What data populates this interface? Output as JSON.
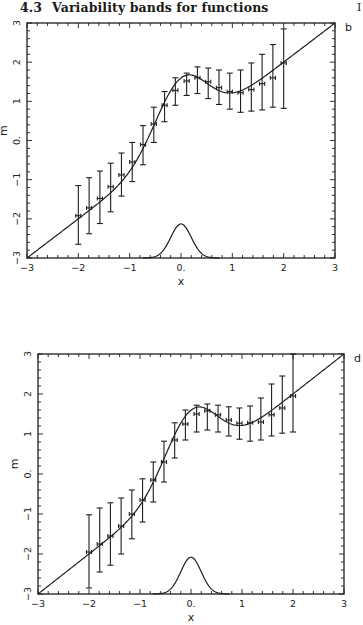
{
  "page": {
    "section_number": "4.3",
    "section_title": "Variability bands for functions",
    "clipped_margin_char": "I"
  },
  "colors": {
    "ink": "#1e1e1e",
    "background": "#ffffff"
  },
  "chart_data": [
    {
      "panel_label": "b",
      "type": "line",
      "title": "",
      "xlabel": "x",
      "ylabel": "m",
      "xlim": [
        -3,
        3
      ],
      "ylim": [
        -3,
        3
      ],
      "xticks": [
        -3,
        -2,
        -1,
        0,
        1,
        2,
        3
      ],
      "xtick_labels": [
        "-3",
        "-2",
        "-1",
        "0.",
        "1",
        "2",
        "3"
      ],
      "yticks": [
        -3,
        -2,
        -1,
        0,
        1,
        2,
        3
      ],
      "ytick_labels": [
        "-3",
        "-2",
        "-1",
        "0.",
        "1",
        "2",
        "3"
      ],
      "grid": false,
      "legend": null,
      "frame_px": {
        "left": 27,
        "top": 23,
        "right": 335,
        "bottom": 258
      },
      "curve": {
        "name": "regression function m(x)",
        "formula": "x + 4*exp(-2x^2)/sqrt(2*pi)",
        "x_range": [
          -3,
          3
        ]
      },
      "density": {
        "name": "design density (bottom bump)",
        "center": 0,
        "sigma": 0.2,
        "baseline": -3,
        "peak_height": 0.87,
        "x_range": [
          -0.75,
          0.75
        ]
      },
      "series": [
        {
          "name": "estimates with variability bands",
          "x": [
            -2.0,
            -1.79,
            -1.58,
            -1.37,
            -1.16,
            -0.95,
            -0.74,
            -0.53,
            -0.32,
            -0.11,
            0.11,
            0.32,
            0.53,
            0.74,
            0.95,
            1.16,
            1.37,
            1.58,
            1.79,
            2.0
          ],
          "y": [
            -1.92,
            -1.72,
            -1.48,
            -1.18,
            -0.88,
            -0.55,
            -0.1,
            0.42,
            0.9,
            1.28,
            1.52,
            1.6,
            1.5,
            1.35,
            1.25,
            1.22,
            1.3,
            1.45,
            1.6,
            1.98
          ],
          "lower": [
            -2.65,
            -2.38,
            -2.12,
            -1.82,
            -1.42,
            -1.05,
            -0.62,
            -0.05,
            0.48,
            0.9,
            1.15,
            1.2,
            1.07,
            0.92,
            0.8,
            0.72,
            0.75,
            0.78,
            0.85,
            0.82
          ],
          "upper": [
            -1.15,
            -0.95,
            -0.78,
            -0.58,
            -0.32,
            -0.05,
            0.38,
            0.85,
            1.25,
            1.6,
            1.72,
            1.88,
            1.85,
            1.8,
            1.72,
            1.8,
            1.98,
            2.2,
            2.45,
            2.85
          ],
          "xerr": 0.05
        }
      ]
    },
    {
      "panel_label": "d",
      "type": "line",
      "title": "",
      "xlabel": "x",
      "ylabel": "m",
      "xlim": [
        -3,
        3
      ],
      "ylim": [
        -3,
        3
      ],
      "xticks": [
        -3,
        -2,
        -1,
        0,
        1,
        2,
        3
      ],
      "xtick_labels": [
        "-3",
        "-2",
        "-1",
        "0.",
        "1",
        "2",
        "3"
      ],
      "yticks": [
        -3,
        -2,
        -1,
        0,
        1,
        2,
        3
      ],
      "ytick_labels": [
        "-3",
        "-2",
        "-1",
        "0.",
        "1",
        "2",
        "3"
      ],
      "grid": false,
      "legend": null,
      "frame_px": {
        "left": 38,
        "top": 354,
        "right": 344,
        "bottom": 594
      },
      "curve": {
        "name": "regression function m(x)",
        "formula": "x + 4*exp(-2x^2)/sqrt(2*pi)",
        "x_range": [
          -3,
          3
        ]
      },
      "density": {
        "name": "design density (bottom bump)",
        "center": 0,
        "sigma": 0.2,
        "baseline": -3,
        "peak_height": 0.92,
        "x_range": [
          -0.75,
          0.75
        ]
      },
      "series": [
        {
          "name": "estimates with variability bands",
          "x": [
            -2.0,
            -1.79,
            -1.58,
            -1.37,
            -1.16,
            -0.95,
            -0.74,
            -0.53,
            -0.32,
            -0.11,
            0.11,
            0.32,
            0.53,
            0.74,
            0.95,
            1.16,
            1.37,
            1.58,
            1.79,
            2.0
          ],
          "y": [
            -1.95,
            -1.75,
            -1.55,
            -1.3,
            -1.0,
            -0.65,
            -0.15,
            0.3,
            0.85,
            1.25,
            1.5,
            1.58,
            1.48,
            1.35,
            1.27,
            1.28,
            1.3,
            1.48,
            1.65,
            1.95
          ],
          "lower": [
            -2.85,
            -2.45,
            -2.28,
            -2.0,
            -1.62,
            -1.2,
            -0.7,
            -0.2,
            0.4,
            0.85,
            1.05,
            1.1,
            1.05,
            0.95,
            0.87,
            0.82,
            0.85,
            0.95,
            1.02,
            1.05
          ],
          "upper": [
            -1.02,
            -0.85,
            -0.72,
            -0.6,
            -0.4,
            -0.12,
            0.3,
            0.82,
            1.28,
            1.6,
            1.72,
            1.75,
            1.72,
            1.68,
            1.65,
            1.7,
            1.9,
            2.25,
            2.45,
            3.0
          ],
          "xerr": 0.05
        }
      ]
    }
  ]
}
